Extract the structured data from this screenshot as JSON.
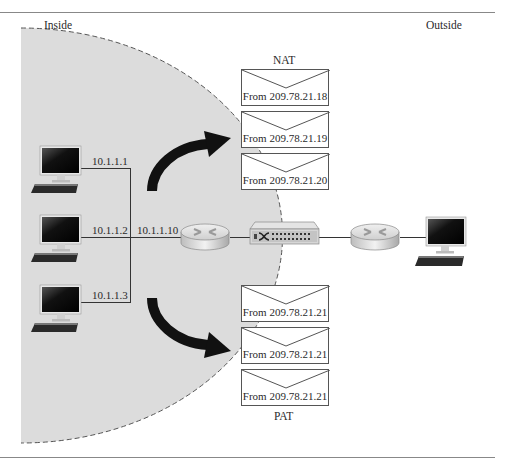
{
  "zones": {
    "inside_label": "Inside",
    "outside_label": "Outside"
  },
  "nat": {
    "label": "NAT",
    "envelopes": [
      {
        "text": "From 209.78.21.18"
      },
      {
        "text": "From 209.78.21.19"
      },
      {
        "text": "From 209.78.21.20"
      }
    ]
  },
  "pat": {
    "label": "PAT",
    "envelopes": [
      {
        "text": "From 209.78.21.21"
      },
      {
        "text": "From 209.78.21.21"
      },
      {
        "text": "From 209.78.21.21"
      }
    ]
  },
  "hosts": [
    {
      "ip": "10.1.1.1"
    },
    {
      "ip": "10.1.1.2"
    },
    {
      "ip": "10.1.1.3"
    }
  ],
  "router_inside_ip": "10.1.1.10",
  "devices": {
    "inside_router": "router-icon",
    "nat_device": "switch-icon",
    "outside_router": "router-icon",
    "outside_host": "computer-icon"
  },
  "colors": {
    "inside_fill": "#dcdcdc",
    "boundary": "#555555",
    "arrow": "#111111",
    "rule": "#888888"
  }
}
